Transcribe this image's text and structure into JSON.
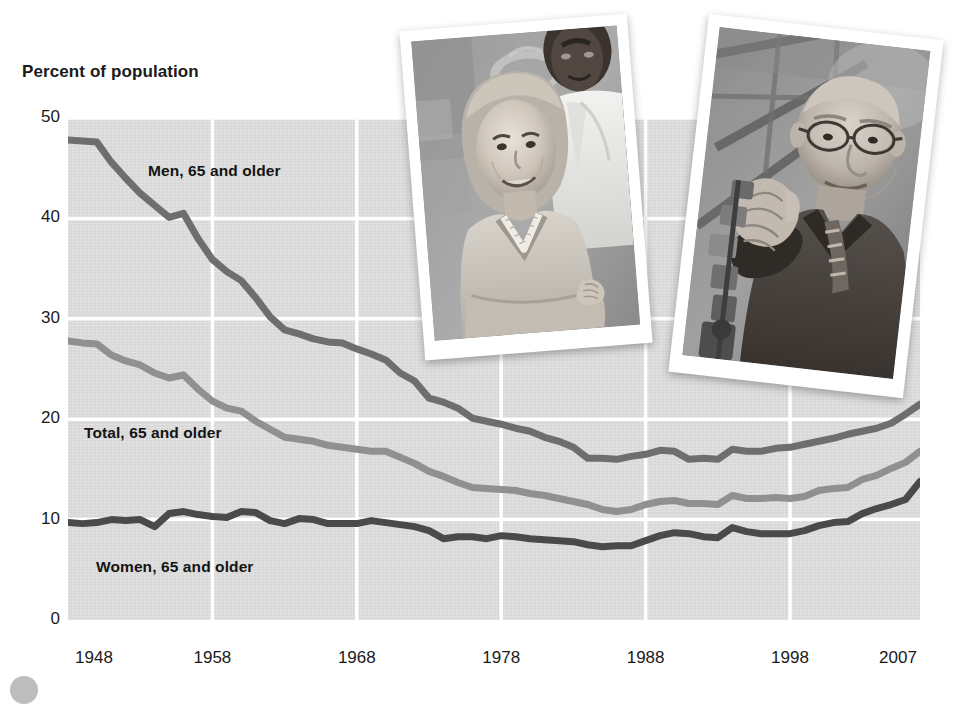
{
  "figure": {
    "background_color": "#ffffff",
    "plot_background_color": "#d8d8d8",
    "gridline_color": "#ffffff"
  },
  "axis_title": "Percent of population",
  "series_labels": {
    "men": "Men, 65 and older",
    "total": "Total, 65 and older",
    "women": "Women, 65 and older"
  },
  "photos": [
    {
      "name": "photo-woman-in-scrubs",
      "caption_text": "",
      "description": "older woman in medical scrubs with colleague in white coat",
      "rotation_deg": -4
    },
    {
      "name": "photo-older-man-with-tools",
      "caption_text": "",
      "description": "elderly man with glasses holding machinery",
      "rotation_deg": 6
    }
  ],
  "chart_data": {
    "type": "line",
    "title": "",
    "subtitle": "",
    "xlabel": "",
    "ylabel": "Percent of population",
    "xlim": [
      1948,
      2007
    ],
    "ylim": [
      0,
      50
    ],
    "yticks": [
      0,
      10,
      20,
      30,
      40,
      50
    ],
    "xticks": [
      1948,
      1958,
      1968,
      1978,
      1988,
      1998,
      2007
    ],
    "grid": true,
    "legend_position": "inline-labels",
    "annotations": [
      {
        "text": "Men, 65 and older",
        "x": 1955,
        "y": 44.5
      },
      {
        "text": "Total, 65 and older",
        "x": 1949.5,
        "y": 20.0
      },
      {
        "text": "Women, 65 and older",
        "x": 1950.5,
        "y": 6.0
      }
    ],
    "x": [
      1948,
      1949,
      1950,
      1951,
      1952,
      1953,
      1954,
      1955,
      1956,
      1957,
      1958,
      1959,
      1960,
      1961,
      1962,
      1963,
      1964,
      1965,
      1966,
      1967,
      1968,
      1969,
      1970,
      1971,
      1972,
      1973,
      1974,
      1975,
      1976,
      1977,
      1978,
      1979,
      1980,
      1981,
      1982,
      1983,
      1984,
      1985,
      1986,
      1987,
      1988,
      1989,
      1990,
      1991,
      1992,
      1993,
      1994,
      1995,
      1996,
      1997,
      1998,
      1999,
      2000,
      2001,
      2002,
      2003,
      2004,
      2005,
      2006,
      2007
    ],
    "series": [
      {
        "name": "Men, 65 and older",
        "color": "#6e6e6e",
        "values": [
          47.8,
          47.7,
          47.6,
          45.6,
          44.0,
          42.5,
          41.3,
          40.1,
          40.5,
          38.0,
          35.9,
          34.7,
          33.8,
          32.1,
          30.2,
          28.9,
          28.5,
          28.0,
          27.7,
          27.6,
          27.0,
          26.5,
          25.9,
          24.6,
          23.8,
          22.1,
          21.7,
          21.1,
          20.1,
          19.8,
          19.5,
          19.1,
          18.8,
          18.2,
          17.8,
          17.2,
          16.1,
          16.1,
          16.0,
          16.3,
          16.5,
          16.9,
          16.8,
          16.0,
          16.1,
          16.0,
          17.0,
          16.8,
          16.8,
          17.1,
          17.2,
          17.5,
          17.8,
          18.1,
          18.5,
          18.8,
          19.1,
          19.6,
          20.5,
          21.5
        ]
      },
      {
        "name": "Total, 65 and older",
        "color": "#909090",
        "values": [
          27.8,
          27.6,
          27.5,
          26.4,
          25.8,
          25.4,
          24.6,
          24.1,
          24.4,
          23.0,
          21.8,
          21.1,
          20.8,
          19.8,
          19.0,
          18.2,
          18.0,
          17.8,
          17.4,
          17.2,
          17.0,
          16.8,
          16.8,
          16.2,
          15.6,
          14.8,
          14.3,
          13.7,
          13.2,
          13.1,
          13.0,
          12.9,
          12.6,
          12.4,
          12.1,
          11.8,
          11.5,
          11.0,
          10.8,
          11.0,
          11.5,
          11.8,
          11.9,
          11.6,
          11.6,
          11.5,
          12.4,
          12.1,
          12.1,
          12.2,
          12.1,
          12.3,
          12.9,
          13.1,
          13.2,
          14.0,
          14.4,
          15.1,
          15.7,
          16.8
        ]
      },
      {
        "name": "Women, 65 and older",
        "color": "#4a4a4a",
        "values": [
          9.7,
          9.6,
          9.7,
          10.0,
          9.9,
          10.0,
          9.3,
          10.6,
          10.8,
          10.5,
          10.3,
          10.2,
          10.8,
          10.7,
          9.9,
          9.6,
          10.1,
          10.0,
          9.6,
          9.6,
          9.6,
          9.9,
          9.7,
          9.5,
          9.3,
          8.9,
          8.1,
          8.3,
          8.3,
          8.1,
          8.4,
          8.3,
          8.1,
          8.0,
          7.9,
          7.8,
          7.5,
          7.3,
          7.4,
          7.4,
          7.9,
          8.4,
          8.7,
          8.6,
          8.3,
          8.2,
          9.2,
          8.8,
          8.6,
          8.6,
          8.6,
          8.9,
          9.4,
          9.7,
          9.8,
          10.6,
          11.1,
          11.5,
          12.0,
          13.8
        ]
      }
    ]
  }
}
